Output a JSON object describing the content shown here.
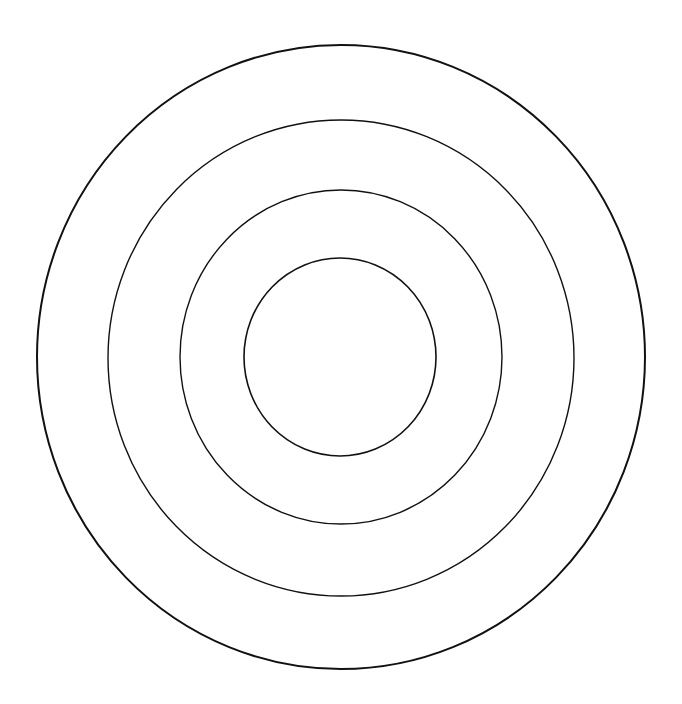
{
  "diagram": {
    "type": "concentric-circles",
    "background": "#ffffff",
    "stroke_color": "#111111",
    "rings": [
      {
        "name": "outer-ring",
        "cx": 341,
        "cy": 357,
        "rx": 304,
        "ry": 312,
        "stroke_width": 2
      },
      {
        "name": "second-ring",
        "cx": 341,
        "cy": 358,
        "rx": 233,
        "ry": 238,
        "stroke_width": 1.4
      },
      {
        "name": "third-ring",
        "cx": 341,
        "cy": 357,
        "rx": 161,
        "ry": 167,
        "stroke_width": 1.4
      },
      {
        "name": "inner-ring",
        "cx": 340,
        "cy": 357,
        "rx": 96,
        "ry": 99,
        "stroke_width": 1.6
      }
    ]
  }
}
